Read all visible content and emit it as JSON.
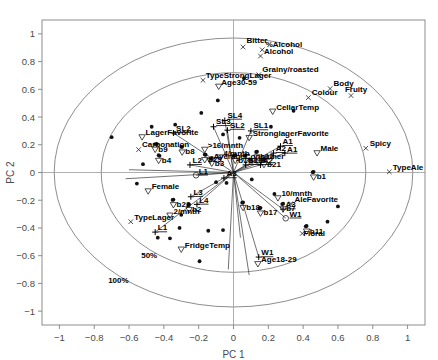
{
  "chart_data": {
    "type": "scatter",
    "title": "",
    "xlabel": "PC 1",
    "ylabel": "PC 2",
    "xlim": [
      -1.1,
      1.1
    ],
    "ylim": [
      -1.1,
      1.1
    ],
    "xticks": [
      "-1",
      "-0.8",
      "-0.6",
      "-0.4",
      "-0.2",
      "0",
      "0.2",
      "0.4",
      "0.6",
      "0.8",
      "1"
    ],
    "xtickvals": [
      -1,
      -0.8,
      -0.6,
      -0.4,
      -0.2,
      0,
      0.2,
      0.4,
      0.6,
      0.8,
      1
    ],
    "yticks": [
      "1",
      "0.8",
      "0.6",
      "0.4",
      "0.2",
      "0",
      "-0.2",
      "-0.4",
      "-0.6",
      "-0.8",
      "-1"
    ],
    "ytickvals": [
      1,
      0.8,
      0.6,
      0.4,
      0.2,
      0,
      -0.2,
      -0.4,
      -0.6,
      -0.8,
      -1
    ],
    "grid": false,
    "legend": "none",
    "ellipses": [
      {
        "label": "50%",
        "rx": 0.76,
        "ry": 0.72,
        "label_x": -0.53,
        "label_y": -0.62
      },
      {
        "label": "100%",
        "rx": 1.03,
        "ry": 0.97,
        "label_x": -0.72,
        "label_y": -0.8
      }
    ],
    "attributes": [
      {
        "name": "Bitter",
        "marker": "x",
        "x": 0.055,
        "y": 0.905,
        "lx": 0.075,
        "ly": 0.935
      },
      {
        "name": "%Alcohol",
        "marker": "x",
        "x": 0.165,
        "y": 0.885,
        "lx": 0.185,
        "ly": 0.905
      },
      {
        "name": "Alcohol",
        "marker": "x",
        "x": 0.155,
        "y": 0.84,
        "lx": 0.175,
        "ly": 0.858
      },
      {
        "name": "Grainy/roasted",
        "marker": "x",
        "x": 0.145,
        "y": 0.705,
        "lx": 0.165,
        "ly": 0.725
      },
      {
        "name": "TypeStrongLager",
        "marker": "x",
        "x": -0.175,
        "y": 0.665,
        "lx": -0.16,
        "ly": 0.685
      },
      {
        "name": "Age30-59",
        "marker": "triangle-down",
        "x": -0.085,
        "y": 0.62,
        "lx": -0.07,
        "ly": 0.628
      },
      {
        "name": "Body",
        "marker": "x",
        "x": 0.555,
        "y": 0.605,
        "lx": 0.575,
        "ly": 0.625
      },
      {
        "name": "Fruity",
        "marker": "x",
        "x": 0.675,
        "y": 0.555,
        "lx": 0.64,
        "ly": 0.58
      },
      {
        "name": "Colour",
        "marker": "x",
        "x": 0.43,
        "y": 0.54,
        "lx": 0.45,
        "ly": 0.556
      },
      {
        "name": "CellarTemp",
        "marker": "triangle-down",
        "x": 0.225,
        "y": 0.44,
        "lx": 0.245,
        "ly": 0.452
      },
      {
        "name": "StronglagerFavorite",
        "marker": "triangle-down",
        "x": 0.09,
        "y": 0.25,
        "lx": 0.11,
        "ly": 0.262
      },
      {
        "name": "Spicy",
        "marker": "x",
        "x": 0.76,
        "y": 0.175,
        "lx": 0.782,
        "ly": 0.192
      },
      {
        "name": "Male",
        "marker": "triangle-down",
        "x": 0.48,
        "y": 0.14,
        "lx": 0.5,
        "ly": 0.152
      },
      {
        "name": "AverageConsumer",
        "marker": "triangle-down",
        "x": -0.135,
        "y": 0.085,
        "lx": -0.115,
        "ly": 0.098
      },
      {
        "name": "TypeAle",
        "marker": "x",
        "x": 0.895,
        "y": 0.005,
        "lx": 0.915,
        "ly": 0.02
      },
      {
        "name": "LagerFavorite",
        "marker": "triangle-down",
        "x": -0.525,
        "y": 0.255,
        "lx": -0.505,
        "ly": 0.268
      },
      {
        "name": "Carbonation",
        "marker": "x",
        "x": -0.545,
        "y": 0.165,
        "lx": -0.525,
        "ly": 0.182
      },
      {
        "name": ">16/mnth",
        "marker": "triangle-down",
        "x": -0.165,
        "y": 0.165,
        "lx": -0.148,
        "ly": 0.178
      },
      {
        "name": "4/mnth",
        "marker": "triangle-down",
        "x": -0.075,
        "y": 0.11,
        "lx": -0.058,
        "ly": 0.122
      },
      {
        "name": "10/mnth",
        "marker": "triangle-down",
        "x": 0.255,
        "y": -0.185,
        "lx": 0.275,
        "ly": -0.172
      },
      {
        "name": "AleFavorite",
        "marker": "x",
        "x": 0.33,
        "y": -0.225,
        "lx": 0.35,
        "ly": -0.212
      },
      {
        "name": "Female",
        "marker": "triangle-down",
        "x": -0.49,
        "y": -0.135,
        "lx": -0.47,
        "ly": -0.122
      },
      {
        "name": "2/mnth",
        "marker": "triangle-down",
        "x": -0.365,
        "y": -0.31,
        "lx": -0.345,
        "ly": -0.298
      },
      {
        "name": "TypeLager",
        "marker": "x",
        "x": -0.59,
        "y": -0.355,
        "lx": -0.57,
        "ly": -0.34
      },
      {
        "name": "FridgeTemp",
        "marker": "triangle-down",
        "x": -0.3,
        "y": -0.555,
        "lx": -0.28,
        "ly": -0.542
      },
      {
        "name": "Age18-29",
        "marker": "triangle-down",
        "x": 0.14,
        "y": -0.66,
        "lx": 0.158,
        "ly": -0.648
      },
      {
        "name": "Floral",
        "marker": "x",
        "x": 0.395,
        "y": -0.44,
        "lx": 0.4,
        "ly": -0.455
      }
    ],
    "beer_points": [
      {
        "name": "b9",
        "x": -0.45,
        "y": 0.205
      },
      {
        "name": "b8",
        "x": -0.295,
        "y": 0.185
      },
      {
        "name": "b4",
        "x": -0.43,
        "y": 0.125
      },
      {
        "name": "b29",
        "x": -0.165,
        "y": 0.13
      },
      {
        "name": "b3",
        "x": -0.125,
        "y": 0.105
      },
      {
        "name": "b10",
        "x": 0.01,
        "y": 0.125
      },
      {
        "name": "b16",
        "x": 0.07,
        "y": 0.125
      },
      {
        "name": "b12",
        "x": 0.135,
        "y": 0.15
      },
      {
        "name": "b21",
        "x": 0.175,
        "y": 0.095
      },
      {
        "name": "b1",
        "x": 0.46,
        "y": 0.005
      },
      {
        "name": "b22",
        "x": -0.345,
        "y": -0.195
      },
      {
        "name": "b2",
        "x": -0.255,
        "y": -0.23
      },
      {
        "name": "b18",
        "x": 0.055,
        "y": -0.215
      },
      {
        "name": "b17",
        "x": 0.155,
        "y": -0.255
      },
      {
        "name": "b7",
        "x": 0.285,
        "y": -0.225
      },
      {
        "name": "b11",
        "x": 0.42,
        "y": -0.385
      }
    ],
    "segment_vectors": [
      {
        "name": "SL4",
        "marker": "plus",
        "x": -0.05,
        "y": 0.375,
        "lx": -0.035,
        "ly": 0.395
      },
      {
        "name": "SL3",
        "marker": "plus",
        "x": -0.115,
        "y": 0.33,
        "lx": -0.1,
        "ly": 0.348
      },
      {
        "name": "SL2",
        "marker": "plus",
        "x": -0.035,
        "y": 0.305,
        "lx": -0.02,
        "ly": 0.322
      },
      {
        "name": "SL1",
        "marker": "plus",
        "x": 0.1,
        "y": 0.3,
        "lx": 0.115,
        "ly": 0.318
      },
      {
        "name": "SL2",
        "marker": "plus",
        "x": -0.345,
        "y": 0.285,
        "lx": -0.33,
        "ly": 0.3
      },
      {
        "name": "SL1",
        "marker": "plus",
        "x": 0.07,
        "y": 0.055,
        "lx": 0.085,
        "ly": 0.068
      },
      {
        "name": "A1",
        "marker": "plus",
        "x": 0.27,
        "y": 0.19,
        "lx": 0.282,
        "ly": 0.205
      },
      {
        "name": "A2",
        "marker": "plus",
        "x": 0.23,
        "y": 0.14,
        "lx": 0.243,
        "ly": 0.155
      },
      {
        "name": "A1",
        "marker": "plus",
        "x": 0.295,
        "y": 0.14,
        "lx": 0.308,
        "ly": 0.15
      },
      {
        "name": "A2",
        "marker": "plus",
        "x": 0.155,
        "y": 0.055,
        "lx": 0.168,
        "ly": 0.068
      },
      {
        "name": "A3",
        "marker": "plus",
        "x": -0.055,
        "y": -0.04,
        "lx": -0.04,
        "ly": -0.028
      },
      {
        "name": "A3",
        "marker": "plus",
        "x": 0.285,
        "y": -0.265,
        "lx": 0.298,
        "ly": -0.252
      },
      {
        "name": "L2",
        "marker": "plus",
        "x": -0.25,
        "y": 0.055,
        "lx": -0.235,
        "ly": 0.068
      },
      {
        "name": "L1",
        "marker": "circle",
        "x": -0.215,
        "y": -0.02,
        "lx": -0.2,
        "ly": -0.008
      },
      {
        "name": "L3",
        "marker": "plus",
        "x": -0.245,
        "y": -0.175,
        "lx": -0.23,
        "ly": -0.162
      },
      {
        "name": "L4",
        "marker": "plus",
        "x": -0.21,
        "y": -0.23,
        "lx": -0.197,
        "ly": -0.218
      },
      {
        "name": "L1",
        "marker": "plus",
        "x": -0.45,
        "y": -0.43,
        "lx": -0.435,
        "ly": -0.418
      },
      {
        "name": "W1",
        "marker": "circle",
        "x": 0.3,
        "y": -0.33,
        "lx": 0.322,
        "ly": -0.318
      },
      {
        "name": "W1",
        "marker": "plus",
        "x": 0.145,
        "y": -0.61,
        "lx": 0.16,
        "ly": -0.598
      }
    ],
    "ray_endpoints": [
      {
        "x": -0.05,
        "y": 0.375
      },
      {
        "x": -0.115,
        "y": 0.33
      },
      {
        "x": -0.035,
        "y": 0.305
      },
      {
        "x": 0.1,
        "y": 0.3
      },
      {
        "x": -0.345,
        "y": 0.285
      },
      {
        "x": 0.07,
        "y": 0.055
      },
      {
        "x": 0.27,
        "y": 0.19
      },
      {
        "x": 0.23,
        "y": 0.14
      },
      {
        "x": 0.295,
        "y": 0.14
      },
      {
        "x": 0.155,
        "y": 0.055
      },
      {
        "x": -0.055,
        "y": -0.04
      },
      {
        "x": 0.285,
        "y": -0.265
      },
      {
        "x": -0.25,
        "y": 0.055
      },
      {
        "x": -0.215,
        "y": -0.02
      },
      {
        "x": -0.245,
        "y": -0.175
      },
      {
        "x": -0.21,
        "y": -0.23
      },
      {
        "x": -0.45,
        "y": -0.43
      },
      {
        "x": 0.3,
        "y": -0.33
      },
      {
        "x": 0.145,
        "y": -0.61
      },
      {
        "x": -0.6,
        "y": 0.02
      },
      {
        "x": -0.62,
        "y": -0.045
      },
      {
        "x": 0.04,
        "y": -0.47
      },
      {
        "x": -0.03,
        "y": -0.7
      },
      {
        "x": 0.09,
        "y": -0.74
      }
    ],
    "scatter_points": [
      {
        "x": -0.7,
        "y": 0.255
      },
      {
        "x": -0.47,
        "y": 0.33
      },
      {
        "x": -0.335,
        "y": 0.345
      },
      {
        "x": -0.185,
        "y": 0.43
      },
      {
        "x": -0.09,
        "y": 0.52
      },
      {
        "x": 0.06,
        "y": 0.68
      },
      {
        "x": 0.215,
        "y": 0.33
      },
      {
        "x": -0.44,
        "y": 0.205
      },
      {
        "x": -0.3,
        "y": 0.185
      },
      {
        "x": -0.425,
        "y": 0.12
      },
      {
        "x": -0.16,
        "y": 0.128
      },
      {
        "x": -0.13,
        "y": 0.1
      },
      {
        "x": 0.0,
        "y": 0.12
      },
      {
        "x": 0.065,
        "y": 0.12
      },
      {
        "x": 0.13,
        "y": 0.148
      },
      {
        "x": 0.17,
        "y": 0.092
      },
      {
        "x": 0.455,
        "y": 0.002
      },
      {
        "x": -0.35,
        "y": -0.198
      },
      {
        "x": -0.26,
        "y": -0.232
      },
      {
        "x": 0.05,
        "y": -0.218
      },
      {
        "x": 0.15,
        "y": -0.258
      },
      {
        "x": 0.28,
        "y": -0.228
      },
      {
        "x": 0.415,
        "y": -0.388
      },
      {
        "x": -0.145,
        "y": -0.42
      },
      {
        "x": -0.06,
        "y": -0.415
      },
      {
        "x": -0.435,
        "y": -0.47
      },
      {
        "x": -0.31,
        "y": -0.4
      },
      {
        "x": -0.195,
        "y": -0.64
      },
      {
        "x": -0.365,
        "y": -0.475
      },
      {
        "x": -0.3,
        "y": -0.305
      },
      {
        "x": 0.105,
        "y": -0.05
      },
      {
        "x": -0.1,
        "y": -0.07
      },
      {
        "x": -0.04,
        "y": -0.075
      },
      {
        "x": 0.235,
        "y": -0.155
      },
      {
        "x": 0.6,
        "y": -0.245
      },
      {
        "x": 0.54,
        "y": -0.355
      },
      {
        "x": -0.52,
        "y": 0.06
      },
      {
        "x": -0.555,
        "y": -0.08
      },
      {
        "x": 0.345,
        "y": 0.445
      },
      {
        "x": -0.06,
        "y": 0.275
      },
      {
        "x": 0.035,
        "y": 0.25
      }
    ]
  }
}
